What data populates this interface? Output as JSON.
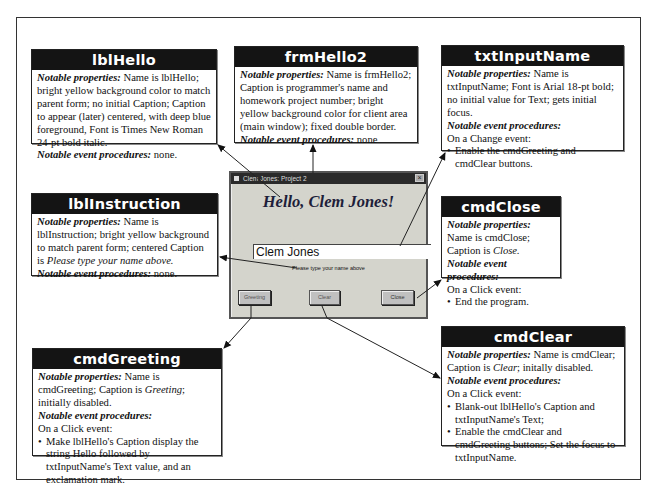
{
  "callouts": {
    "lblHello": {
      "title": "lblHello",
      "props_label": "Notable properties:",
      "props_text": " Name is lblHello; bright yellow background color to match parent form; no initial Caption; Caption to appear (later) centered, with deep blue foreground, Font is Times New Roman 24-pt bold italic.",
      "events_label": "Notable event procedures:",
      "events_text": " none."
    },
    "frmHello2": {
      "title": "frmHello2",
      "props_label": "Notable properties:",
      "props_text": " Name is frmHello2; Caption is programmer's name and homework project number; bright yellow background color for client area (main window); fixed double border.",
      "events_label": "Notable event procedures:",
      "events_text": " none"
    },
    "txtInputName": {
      "title": "txtInputName",
      "props_label": "Notable properties:",
      "props_text": " Name is txtInputName; Font is Arial 18-pt bold; no initial value for Text; gets initial focus.",
      "events_label": "Notable event procedures:",
      "event_trigger": "On a Change event:",
      "bullets": [
        "Enable the cmdGreeting and cmdClear buttons."
      ]
    },
    "lblInstruction": {
      "title": "lblInstruction",
      "props_label": "Notable properties:",
      "props_text_a": " Name is lblInstruction; bright yellow background to match parent form; centered Caption is ",
      "props_text_italic": "Please type your name above.",
      "events_label": "Notable event procedures:",
      "events_text": " none."
    },
    "cmdClose": {
      "title": "cmdClose",
      "props_label": "Notable properties:",
      "props_text_a": " Name is cmdClose; Caption is ",
      "props_text_italic": "Close.",
      "events_label": "Notable event procedures:",
      "event_trigger": "On a Click event:",
      "bullets": [
        "End the program."
      ]
    },
    "cmdGreeting": {
      "title": "cmdGreeting",
      "props_label": "Notable properties:",
      "props_text_a": " Name is cmdGreeting; Caption is ",
      "props_text_italic": "Greeting",
      "props_text_b": "; initially disabled.",
      "events_label": "Notable event procedures:",
      "event_trigger": "On a Click event:",
      "bullets": [
        "Make lblHello's Caption display the string Hello followed by txtInputName's Text value, and an exclamation mark."
      ]
    },
    "cmdClear": {
      "title": "cmdClear",
      "props_label": "Notable properties:",
      "props_text_a": " Name is cmdClear; Caption is ",
      "props_text_italic": "Clear",
      "props_text_b": "; initally disabled.",
      "events_label": "Notable event procedures:",
      "event_trigger": "On a Click event:",
      "bullets": [
        "Blank-out lblHello's Caption and txtInputName's Text;",
        "Enable the cmdClear and cmdGreeting buttons; Set the focus to txtInputName."
      ]
    }
  },
  "form": {
    "title": "Clem Jones: Project 2",
    "close_glyph": "×",
    "hello_caption": "Hello, Clem Jones!",
    "input_value": "Clem Jones",
    "instruction": "Please type your name above",
    "buttons": {
      "greeting": "Greeting",
      "clear": "Clear",
      "close": "Close"
    }
  }
}
